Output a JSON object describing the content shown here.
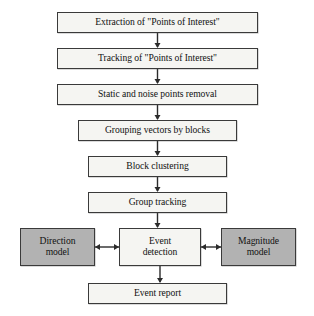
{
  "diagram": {
    "colors": {
      "box_fill": "#f5f5f2",
      "shaded_fill": "#b2b2b2",
      "stroke": "#3a3a3a",
      "text": "#111111",
      "background": "#ffffff"
    },
    "nodes": [
      {
        "id": "extraction",
        "label": "Extraction of \"Points of Interest\"",
        "shaded": false,
        "x": 57,
        "y": 12,
        "w": 201,
        "h": 21
      },
      {
        "id": "tracking",
        "label": "Tracking of \"Points of Interest\"",
        "shaded": false,
        "x": 57,
        "y": 48,
        "w": 201,
        "h": 21
      },
      {
        "id": "removal",
        "label": "Static and noise points removal",
        "shaded": false,
        "x": 57,
        "y": 84,
        "w": 201,
        "h": 21
      },
      {
        "id": "grouping",
        "label": "Grouping vectors by blocks",
        "shaded": false,
        "x": 78,
        "y": 120,
        "w": 159,
        "h": 21
      },
      {
        "id": "block-clustering",
        "label": "Block clustering",
        "shaded": false,
        "x": 88,
        "y": 156,
        "w": 139,
        "h": 21
      },
      {
        "id": "group-tracking",
        "label": "Group tracking",
        "shaded": false,
        "x": 88,
        "y": 192,
        "w": 139,
        "h": 21
      },
      {
        "id": "direction-model",
        "label": "Direction\nmodel",
        "shaded": true,
        "x": 20,
        "y": 228,
        "w": 75,
        "h": 38
      },
      {
        "id": "event-detection",
        "label": "Event\ndetection",
        "shaded": false,
        "x": 119,
        "y": 228,
        "w": 82,
        "h": 38
      },
      {
        "id": "magnitude-model",
        "label": "Magnitude\nmodel",
        "shaded": true,
        "x": 221,
        "y": 228,
        "w": 75,
        "h": 38
      },
      {
        "id": "event-report",
        "label": "Event report",
        "shaded": false,
        "x": 88,
        "y": 283,
        "w": 139,
        "h": 21
      }
    ],
    "connectors": [
      {
        "id": "extraction-to-tracking",
        "from": "extraction",
        "to": "tracking",
        "direction": "down"
      },
      {
        "id": "tracking-to-removal",
        "from": "tracking",
        "to": "removal",
        "direction": "down"
      },
      {
        "id": "removal-to-grouping",
        "from": "removal",
        "to": "grouping",
        "direction": "down"
      },
      {
        "id": "grouping-to-block-clustering",
        "from": "grouping",
        "to": "block-clustering",
        "direction": "down"
      },
      {
        "id": "block-clustering-to-group-tracking",
        "from": "block-clustering",
        "to": "group-tracking",
        "direction": "down"
      },
      {
        "id": "group-tracking-to-event-detection",
        "from": "group-tracking",
        "to": "event-detection",
        "direction": "down"
      },
      {
        "id": "direction-model-to-event-detection",
        "from": "direction-model",
        "to": "event-detection",
        "direction": "both"
      },
      {
        "id": "magnitude-model-to-event-detection",
        "from": "magnitude-model",
        "to": "event-detection",
        "direction": "both"
      },
      {
        "id": "event-detection-to-event-report",
        "from": "event-detection",
        "to": "event-report",
        "direction": "down"
      }
    ]
  }
}
